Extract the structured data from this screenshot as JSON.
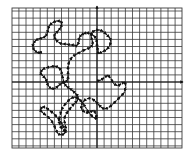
{
  "figure": {
    "grid": {
      "left": 12,
      "top": 8,
      "right": 182,
      "bottom": 148,
      "spacing": 7.1,
      "line_color": "#3a3a3a",
      "background": "#ffffff"
    },
    "axes": {
      "origin_x": 97,
      "origin_y": 82,
      "color": "#111111",
      "x_arrow": true,
      "y_arrow": true
    },
    "curve": {
      "color": "#111111",
      "closed": true,
      "points": [
        [
          97,
          81
        ],
        [
          101,
          80
        ],
        [
          105,
          77
        ],
        [
          108,
          75
        ],
        [
          111,
          79
        ],
        [
          114,
          84
        ],
        [
          118,
          86
        ],
        [
          122,
          83
        ],
        [
          125,
          82
        ],
        [
          126,
          87
        ],
        [
          124,
          93
        ],
        [
          120,
          97
        ],
        [
          116,
          101
        ],
        [
          112,
          105
        ],
        [
          108,
          108
        ],
        [
          104,
          109
        ],
        [
          101,
          107
        ],
        [
          98,
          104
        ],
        [
          95,
          101
        ],
        [
          91,
          98
        ],
        [
          86,
          99
        ],
        [
          83,
          102
        ],
        [
          81,
          106
        ],
        [
          82,
          110
        ],
        [
          86,
          113
        ],
        [
          90,
          112
        ],
        [
          94,
          110
        ],
        [
          96,
          115
        ],
        [
          97,
          119
        ],
        [
          93,
          117
        ],
        [
          89,
          113
        ],
        [
          86,
          108
        ],
        [
          82,
          102
        ],
        [
          78,
          98
        ],
        [
          74,
          97
        ],
        [
          70,
          99
        ],
        [
          66,
          103
        ],
        [
          63,
          107
        ],
        [
          61,
          111
        ],
        [
          60,
          116
        ],
        [
          59,
          121
        ],
        [
          60,
          126
        ],
        [
          63,
          130
        ],
        [
          66,
          132
        ],
        [
          64,
          128
        ],
        [
          62,
          124
        ],
        [
          60,
          121
        ],
        [
          57,
          117
        ],
        [
          53,
          113
        ],
        [
          49,
          110
        ],
        [
          45,
          107
        ],
        [
          42,
          107
        ],
        [
          40,
          110
        ],
        [
          43,
          113
        ],
        [
          47,
          116
        ],
        [
          51,
          120
        ],
        [
          54,
          125
        ],
        [
          56,
          130
        ],
        [
          58,
          134
        ],
        [
          62,
          135
        ],
        [
          65,
          133
        ],
        [
          66,
          129
        ],
        [
          65,
          124
        ],
        [
          64,
          119
        ],
        [
          66,
          114
        ],
        [
          69,
          110
        ],
        [
          72,
          106
        ],
        [
          75,
          103
        ],
        [
          78,
          100
        ],
        [
          78,
          96
        ],
        [
          75,
          93
        ],
        [
          72,
          90
        ],
        [
          69,
          88
        ],
        [
          66,
          86
        ],
        [
          64,
          83
        ],
        [
          63,
          79
        ],
        [
          62,
          74
        ],
        [
          61,
          70
        ],
        [
          58,
          67
        ],
        [
          54,
          66
        ],
        [
          50,
          67
        ],
        [
          45,
          68
        ],
        [
          42,
          70
        ],
        [
          40,
          73
        ],
        [
          43,
          76
        ],
        [
          46,
          79
        ],
        [
          47,
          83
        ],
        [
          49,
          87
        ],
        [
          52,
          89
        ],
        [
          56,
          88
        ],
        [
          59,
          85
        ],
        [
          62,
          83
        ],
        [
          66,
          82
        ],
        [
          68,
          79
        ],
        [
          68,
          75
        ],
        [
          68,
          70
        ],
        [
          68,
          65
        ],
        [
          70,
          60
        ],
        [
          73,
          56
        ],
        [
          77,
          54
        ],
        [
          82,
          51
        ],
        [
          87,
          49
        ],
        [
          91,
          47
        ],
        [
          93,
          44
        ],
        [
          92,
          40
        ],
        [
          91,
          36
        ],
        [
          92,
          32
        ],
        [
          96,
          30
        ],
        [
          100,
          30
        ],
        [
          104,
          32
        ],
        [
          107,
          35
        ],
        [
          110,
          38
        ],
        [
          111,
          42
        ],
        [
          109,
          47
        ],
        [
          106,
          50
        ],
        [
          102,
          52
        ],
        [
          98,
          54
        ],
        [
          98,
          50
        ],
        [
          97,
          46
        ],
        [
          97,
          42
        ],
        [
          96,
          38
        ],
        [
          93,
          35
        ],
        [
          89,
          33
        ],
        [
          86,
          33
        ],
        [
          83,
          34
        ],
        [
          81,
          35
        ],
        [
          79,
          38
        ],
        [
          79,
          42
        ],
        [
          77,
          46
        ],
        [
          74,
          45
        ],
        [
          70,
          45
        ],
        [
          66,
          44
        ],
        [
          62,
          44
        ],
        [
          58,
          42
        ],
        [
          55,
          39
        ],
        [
          54,
          36
        ],
        [
          56,
          33
        ],
        [
          59,
          30
        ],
        [
          61,
          27
        ],
        [
          62,
          23
        ],
        [
          60,
          21
        ],
        [
          56,
          21
        ],
        [
          52,
          23
        ],
        [
          49,
          26
        ],
        [
          48,
          30
        ],
        [
          47,
          34
        ],
        [
          45,
          37
        ],
        [
          42,
          38
        ],
        [
          38,
          39
        ],
        [
          35,
          41
        ],
        [
          33,
          44
        ],
        [
          33,
          48
        ],
        [
          35,
          51
        ],
        [
          38,
          53
        ],
        [
          42,
          52
        ],
        [
          38,
          53
        ]
      ]
    }
  }
}
